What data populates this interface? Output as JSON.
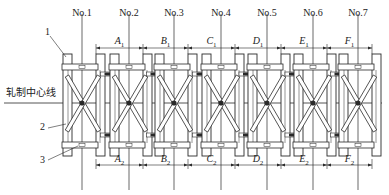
{
  "figure": {
    "centerline_label": "轧制中心线",
    "callouts": [
      {
        "id": "1",
        "label": "1"
      },
      {
        "id": "2",
        "label": "2"
      },
      {
        "id": "3",
        "label": "3"
      }
    ],
    "stands": [
      {
        "label": "No.1",
        "x": 82
      },
      {
        "label": "No.2",
        "x": 129
      },
      {
        "label": "No.3",
        "x": 174
      },
      {
        "label": "No.4",
        "x": 221
      },
      {
        "label": "No.5",
        "x": 267
      },
      {
        "label": "No.6",
        "x": 313
      },
      {
        "label": "No.7",
        "x": 358
      }
    ],
    "top_dims": [
      {
        "letter": "A",
        "sub": "1"
      },
      {
        "letter": "B",
        "sub": "1"
      },
      {
        "letter": "C",
        "sub": "1"
      },
      {
        "letter": "D",
        "sub": "1"
      },
      {
        "letter": "E",
        "sub": "1"
      },
      {
        "letter": "F",
        "sub": "1"
      }
    ],
    "bottom_dims": [
      {
        "letter": "A",
        "sub": "2"
      },
      {
        "letter": "B",
        "sub": "2"
      },
      {
        "letter": "C",
        "sub": "2"
      },
      {
        "letter": "D",
        "sub": "2"
      },
      {
        "letter": "E",
        "sub": "2"
      },
      {
        "letter": "F",
        "sub": "2"
      }
    ],
    "line_color": "#2a2a2a"
  }
}
